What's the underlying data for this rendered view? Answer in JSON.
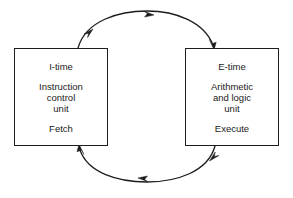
{
  "diagram": {
    "type": "cycle-diagram",
    "background_color": "#ffffff",
    "stroke_color": "#1d1d1d",
    "text_color": "#1a1a1a",
    "nodes": [
      {
        "id": "i-time",
        "title": "I-time",
        "body_lines": [
          "Instruction",
          "control",
          "unit"
        ],
        "action": "Fetch"
      },
      {
        "id": "e-time",
        "title": "E-time",
        "body_lines": [
          "Arithmetic",
          "and logic",
          "unit"
        ],
        "action": "Execute"
      }
    ],
    "connectors": [
      {
        "id": "top-arc",
        "from": "i-time",
        "to": "e-time",
        "direction": "left-to-right",
        "shape": "arc-over"
      },
      {
        "id": "bottom-arc",
        "from": "e-time",
        "to": "i-time",
        "direction": "right-to-left",
        "shape": "arc-under"
      }
    ]
  }
}
